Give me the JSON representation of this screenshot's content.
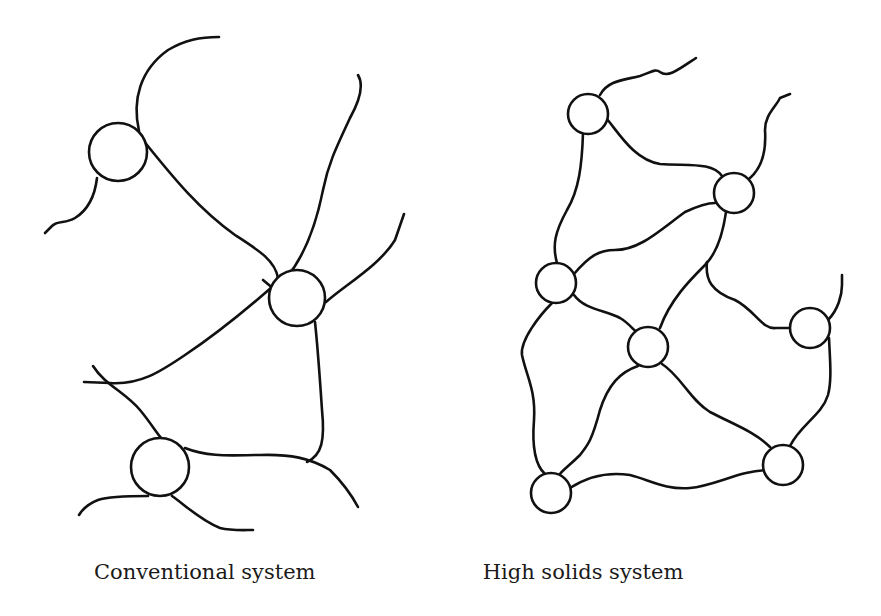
{
  "figure": {
    "panels": [
      {
        "id": "conventional",
        "caption": "Conventional system",
        "description": "Sparse network: few cross-link nodes connected by long polymer chains with many loose ends",
        "nodes": [
          {
            "id": "A",
            "cx": 118,
            "cy": 152,
            "r": 29
          },
          {
            "id": "B",
            "cx": 297,
            "cy": 298,
            "r": 28
          },
          {
            "id": "C",
            "cx": 160,
            "cy": 467,
            "r": 29
          }
        ]
      },
      {
        "id": "high_solids",
        "caption": "High solids system",
        "description": "Dense network: many small cross-link nodes connected by short chains",
        "nodes": [
          {
            "id": "1",
            "cx": 588,
            "cy": 114,
            "r": 20
          },
          {
            "id": "2",
            "cx": 734,
            "cy": 193,
            "r": 20
          },
          {
            "id": "3",
            "cx": 556,
            "cy": 283,
            "r": 20
          },
          {
            "id": "4",
            "cx": 648,
            "cy": 347,
            "r": 20
          },
          {
            "id": "5",
            "cx": 810,
            "cy": 328,
            "r": 20
          },
          {
            "id": "6",
            "cx": 783,
            "cy": 465,
            "r": 20
          },
          {
            "id": "7",
            "cx": 551,
            "cy": 493,
            "r": 20
          }
        ]
      }
    ],
    "colors": {
      "line": "#111111",
      "background": "#ffffff"
    }
  }
}
